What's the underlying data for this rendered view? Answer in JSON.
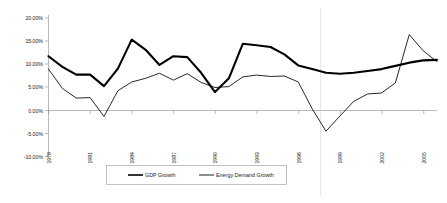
{
  "chart_data": {
    "type": "line",
    "title": "",
    "xlabel": "",
    "ylabel": "",
    "ylim": [
      -10,
      20
    ],
    "ytick_labels": [
      "20.00%",
      "15.00%",
      "10.00%",
      "5.00%",
      "0.00%",
      "-5.00%",
      "-10.00%"
    ],
    "ytick_values": [
      20,
      15,
      10,
      5,
      0,
      -5,
      -10
    ],
    "grid": false,
    "legend_position": "bottom-center",
    "x": [
      1978,
      1979,
      1980,
      1981,
      1982,
      1983,
      1984,
      1985,
      1986,
      1987,
      1988,
      1989,
      1990,
      1991,
      1992,
      1993,
      1994,
      1995,
      1996,
      1997,
      1998,
      1999,
      2000,
      2001,
      2002,
      2003,
      2004,
      2005,
      2006
    ],
    "xtick_labels": [
      "1978",
      "1981",
      "1984",
      "1987",
      "1990",
      "1993",
      "1996",
      "1999",
      "2002",
      "2005"
    ],
    "xtick_values": [
      1978,
      1981,
      1984,
      1987,
      1990,
      1993,
      1996,
      1999,
      2002,
      2005
    ],
    "series": [
      {
        "name": "GDP Growth",
        "style": "thick-black-line",
        "color": "#000000",
        "values": [
          11.8,
          9.5,
          7.8,
          7.8,
          5.3,
          9.1,
          15.4,
          13.2,
          9.9,
          11.8,
          11.6,
          8.2,
          4.0,
          7.0,
          14.5,
          14.2,
          13.8,
          12.2,
          9.8,
          9.0,
          8.2,
          8.0,
          8.2,
          8.6,
          9.0,
          9.7,
          10.4,
          10.9,
          11.0
        ]
      },
      {
        "name": "Energy Demand Growth",
        "style": "thin-black-line",
        "color": "#000000",
        "values": [
          9.0,
          4.8,
          2.7,
          2.8,
          -1.3,
          4.3,
          6.2,
          7.0,
          8.1,
          6.6,
          8.0,
          6.1,
          5.0,
          5.2,
          7.3,
          7.7,
          7.4,
          7.5,
          6.2,
          0.4,
          -4.5,
          -1.2,
          2.0,
          3.6,
          3.8,
          6.0,
          16.5,
          13.0,
          10.6
        ]
      }
    ],
    "legend": [
      {
        "label": "GDP Growth"
      },
      {
        "label": "Energy Demand Growth"
      }
    ]
  }
}
